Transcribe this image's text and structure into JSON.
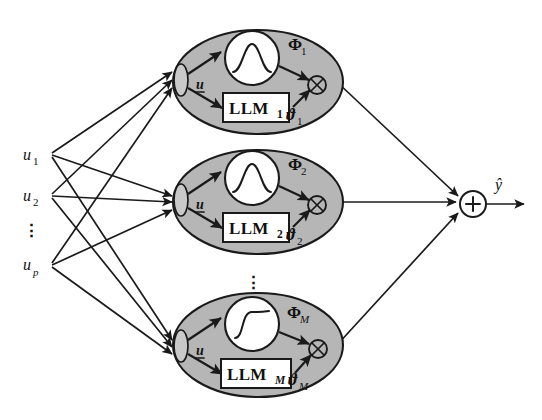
{
  "figure": {
    "type": "diagram",
    "width": 542,
    "height": 420,
    "background_color": "#ffffff",
    "line_color": "#1a1a1a",
    "module_fill_color": "#b6b6b6",
    "node_fill_color": "#ffffff"
  },
  "inputs": {
    "label": "inputs",
    "items": [
      {
        "name": "input-u1",
        "base": "u",
        "sub": "1",
        "sub_italic": false
      },
      {
        "name": "input-u2",
        "base": "u",
        "sub": "2",
        "sub_italic": false
      },
      {
        "name": "input-up",
        "base": "u",
        "sub": "p",
        "sub_italic": true
      }
    ],
    "ellipsis": "⋮"
  },
  "modules": [
    {
      "name": "module-1",
      "bus_label": {
        "base": "u",
        "underlined": true
      },
      "activation": {
        "name": "gaussian-curve-icon",
        "shape": "gaussian"
      },
      "llm": {
        "base": "LLM",
        "sub": "1",
        "sub_italic": false
      },
      "validity": {
        "base": "Φ",
        "sub": "1",
        "sub_italic": false
      },
      "parameter": {
        "base": "ϑ",
        "sub": "1",
        "sub_italic": false
      },
      "operator": {
        "name": "multiply-node",
        "symbol": "⊗"
      }
    },
    {
      "name": "module-2",
      "bus_label": {
        "base": "u",
        "underlined": true
      },
      "activation": {
        "name": "gaussian-curve-icon",
        "shape": "gaussian"
      },
      "llm": {
        "base": "LLM",
        "sub": "2",
        "sub_italic": false
      },
      "validity": {
        "base": "Φ",
        "sub": "2",
        "sub_italic": false
      },
      "parameter": {
        "base": "ϑ",
        "sub": "2",
        "sub_italic": false
      },
      "operator": {
        "name": "multiply-node",
        "symbol": "⊗"
      }
    },
    {
      "name": "module-M",
      "bus_label": {
        "base": "u",
        "underlined": true
      },
      "activation": {
        "name": "sigmoid-curve-icon",
        "shape": "sigmoid"
      },
      "llm": {
        "base": "LLM",
        "sub": "M",
        "sub_italic": true
      },
      "validity": {
        "base": "Φ",
        "sub": "M",
        "sub_italic": true
      },
      "parameter": {
        "base": "ϑ",
        "sub": "M",
        "sub_italic": true
      },
      "operator": {
        "name": "multiply-node",
        "symbol": "⊗"
      }
    }
  ],
  "module_ellipsis": "⋮",
  "output": {
    "sum_node": {
      "name": "summation-node",
      "symbol": "+"
    },
    "label": {
      "base": "ŷ"
    }
  }
}
